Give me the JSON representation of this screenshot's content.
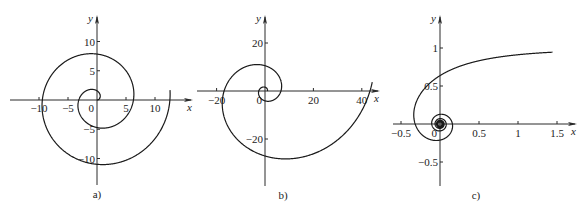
{
  "figure": {
    "panels": [
      {
        "id": "a",
        "caption": "a)",
        "curve_type": "archimedean-spiral",
        "equation": "r = θ",
        "x_axis_label": "x",
        "y_axis_label": "y",
        "x_range": [
          -15,
          16.5
        ],
        "y_range": [
          -14.5,
          14.5
        ],
        "x_ticks": [
          {
            "value": -10,
            "label": "−10"
          },
          {
            "value": -5,
            "label": "−5"
          },
          {
            "value": 5,
            "label": "5"
          },
          {
            "value": 10,
            "label": "10"
          }
        ],
        "y_ticks": [
          {
            "value": 10,
            "label": "10"
          },
          {
            "value": 5,
            "label": "5"
          },
          {
            "value": -5,
            "label": "−5"
          },
          {
            "value": -10,
            "label": "−10"
          }
        ],
        "origin_label": "0",
        "theta_range": [
          0,
          12.7
        ]
      },
      {
        "id": "b",
        "caption": "b)",
        "curve_type": "logarithmic-spiral",
        "equation": "r = e^(0.3θ)",
        "x_axis_label": "x",
        "y_axis_label": "y",
        "x_range": [
          -28,
          47
        ],
        "y_range": [
          -39,
          31
        ],
        "x_ticks": [
          {
            "value": -20,
            "label": "−20"
          },
          {
            "value": 20,
            "label": "20"
          },
          {
            "value": 40,
            "label": "40"
          }
        ],
        "y_ticks": [
          {
            "value": 20,
            "label": "20"
          },
          {
            "value": -20,
            "label": "−20"
          }
        ],
        "origin_label": "0",
        "theta_range": [
          0,
          12.65
        ]
      },
      {
        "id": "c",
        "caption": "c)",
        "curve_type": "hyperbolic-spiral",
        "equation": "r = 1/θ",
        "x_axis_label": "x",
        "y_axis_label": "y",
        "x_range": [
          -0.6,
          1.75
        ],
        "y_range": [
          -0.8,
          1.4
        ],
        "x_ticks": [
          {
            "value": -0.5,
            "label": "−0.5"
          },
          {
            "value": 0.5,
            "label": "0.5"
          },
          {
            "value": 1,
            "label": "1"
          },
          {
            "value": 1.5,
            "label": "1.5"
          }
        ],
        "y_ticks": [
          {
            "value": 1,
            "label": "1"
          },
          {
            "value": 0.5,
            "label": "0.5"
          },
          {
            "value": -0.5,
            "label": "−0.5"
          }
        ],
        "origin_label": "0",
        "theta_range": [
          0.58,
          40
        ]
      }
    ]
  }
}
